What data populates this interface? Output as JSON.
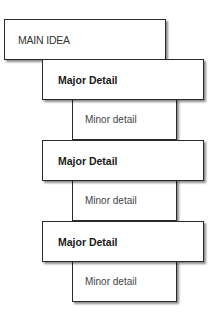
{
  "diagram": {
    "main_idea": "MAIN IDEA",
    "groups": [
      {
        "major": "Major Detail",
        "minor": "Minor detail"
      },
      {
        "major": "Major Detail",
        "minor": "Minor detail"
      },
      {
        "major": "Major Detail",
        "minor": "Minor detail"
      }
    ]
  }
}
